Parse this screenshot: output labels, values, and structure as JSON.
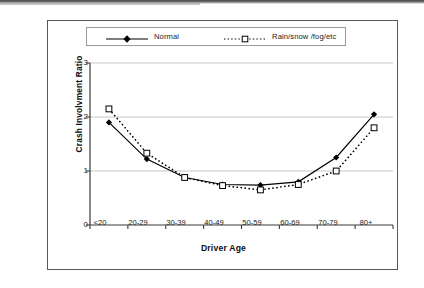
{
  "figure": {
    "legend": {
      "position": "top",
      "entries": [
        {
          "label": "Normal",
          "marker": "filled-diamond",
          "line": "solid",
          "color": "#000000"
        },
        {
          "label": "Rain/snow /fog/etc",
          "marker": "open-square",
          "line": "dotted",
          "color": "#000000"
        }
      ]
    }
  },
  "chart_data": {
    "type": "line",
    "title": "",
    "xlabel": "Driver Age",
    "ylabel": "Crash Involvment Ratio",
    "categories": [
      "<20",
      "20-29",
      "30-39",
      "40-49",
      "50-59",
      "60-69",
      "70-79",
      "80+"
    ],
    "ylim": [
      0,
      3
    ],
    "yticks": [
      0,
      1,
      2,
      3
    ],
    "ytick_labels": [
      "0",
      "1",
      "2",
      "3"
    ],
    "grid": "horizontal",
    "legend_position": "top",
    "series": [
      {
        "name": "Normal",
        "marker": "filled-diamond",
        "line": "solid",
        "values": [
          1.9,
          1.22,
          0.88,
          0.75,
          0.74,
          0.8,
          1.25,
          2.05
        ]
      },
      {
        "name": "Rain/snow /fog/etc",
        "marker": "open-square",
        "line": "dotted",
        "values": [
          2.15,
          1.33,
          0.88,
          0.73,
          0.65,
          0.75,
          1.0,
          1.8
        ]
      }
    ]
  }
}
